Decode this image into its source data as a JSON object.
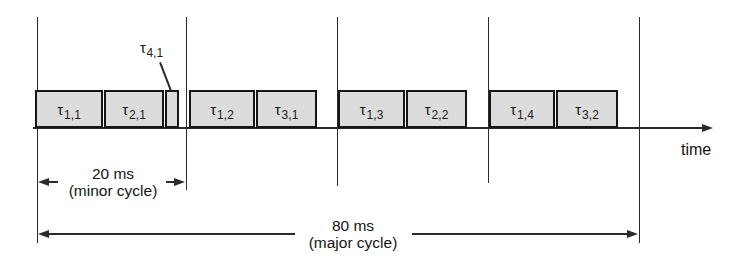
{
  "figure": {
    "type": "cyclic-executive-schedule-timeline",
    "axis_label": "time",
    "tasks": [
      {
        "tau": "τ",
        "index": "1,1",
        "minor_cycle": 1
      },
      {
        "tau": "τ",
        "index": "2,1",
        "minor_cycle": 1
      },
      {
        "tau": "τ",
        "index": "4,1",
        "minor_cycle": 1,
        "callout": true
      },
      {
        "tau": "τ",
        "index": "1,2",
        "minor_cycle": 2
      },
      {
        "tau": "τ",
        "index": "3,1",
        "minor_cycle": 2
      },
      {
        "tau": "τ",
        "index": "1,3",
        "minor_cycle": 3
      },
      {
        "tau": "τ",
        "index": "2,2",
        "minor_cycle": 3
      },
      {
        "tau": "τ",
        "index": "1,4",
        "minor_cycle": 4
      },
      {
        "tau": "τ",
        "index": "3,2",
        "minor_cycle": 4
      }
    ],
    "minor_cycle_annotation": {
      "line1": "20 ms",
      "line2": "(minor cycle)"
    },
    "major_cycle_annotation": {
      "line1": "80 ms",
      "line2": "(major cycle)"
    },
    "colors": {
      "task_fill": "#dcdcdc",
      "line": "#2b2b2b",
      "border": "#161616",
      "background": "#ffffff"
    }
  }
}
